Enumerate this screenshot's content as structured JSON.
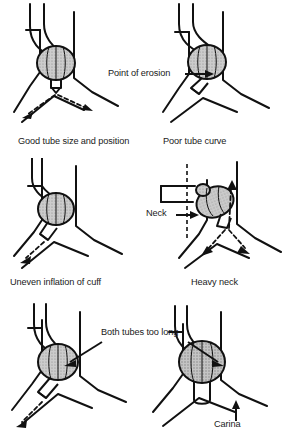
{
  "figure": {
    "background_color": "#ffffff",
    "line_color": "#111111",
    "cuff_fill_color": "#c9c9c9",
    "text_color": "#1a1a1a"
  },
  "panels": [
    {
      "id": "good-tube",
      "caption": "Good tube size and position",
      "position": "top-left",
      "cuff_style": "hatched-ellipse",
      "airflow_arrows": "dashed-bilateral",
      "annotation": null
    },
    {
      "id": "poor-curve",
      "caption": "Poor tube curve",
      "position": "top-right",
      "cuff_style": "hatched-ellipse-offset",
      "airflow_arrows": "none",
      "annotation": "Point of erosion"
    },
    {
      "id": "uneven-cuff",
      "caption": "Uneven inflation of cuff",
      "position": "middle-left",
      "cuff_style": "hatched-ellipse",
      "airflow_arrows": "dashed-left",
      "annotation": null
    },
    {
      "id": "heavy-neck",
      "caption": "Heavy neck",
      "position": "middle-right",
      "cuff_style": "hatched-ellipse-tilted",
      "airflow_arrows": "dashed-trilateral",
      "annotation": "Neck"
    },
    {
      "id": "both-tubes-long-left",
      "caption": "",
      "position": "bottom-left",
      "cuff_style": "hatched-ellipse",
      "airflow_arrows": "dashed-left",
      "annotation": "Both tubes too long"
    },
    {
      "id": "both-tubes-long-right",
      "caption": "",
      "position": "bottom-right",
      "cuff_style": "hatched-ellipse-large",
      "airflow_arrows": "none",
      "annotation": "Carina"
    }
  ],
  "captions": {
    "good_tube": "Good tube size and position",
    "poor_curve": "Poor tube curve",
    "uneven_cuff": "Uneven inflation of cuff",
    "heavy_neck": "Heavy neck"
  },
  "annotations": {
    "point_of_erosion": "Point of erosion",
    "neck": "Neck",
    "both_tubes_too_long": "Both tubes too long",
    "carina": "Carina"
  }
}
